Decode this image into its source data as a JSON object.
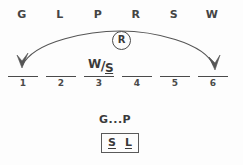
{
  "roster": {
    "letters": [
      {
        "label": "G",
        "x": 22
      },
      {
        "label": "L",
        "x": 60
      },
      {
        "label": "P",
        "x": 98
      },
      {
        "label": "R",
        "x": 136
      },
      {
        "label": "S",
        "x": 174
      },
      {
        "label": "W",
        "x": 212
      }
    ]
  },
  "slots": [
    {
      "number": "1",
      "x": 8
    },
    {
      "number": "2",
      "x": 46
    },
    {
      "number": "3",
      "x": 84
    },
    {
      "number": "4",
      "x": 122
    },
    {
      "number": "5",
      "x": 160
    },
    {
      "number": "6",
      "x": 198
    }
  ],
  "arc": {
    "token_label": "R",
    "path": "M 22 66 C 34 40, 92 31, 120 31 C 152 31, 204 42, 214 66",
    "left_arrow": "M 22 68 L 17 55 L 22 61 L 28 53 Z",
    "right_arrow": "M 215 70 L 209 57 L 215 63 L 220 55 Z",
    "stroke": "#555555"
  },
  "annotations": {
    "fraction": {
      "numerator": "W",
      "bar": "/",
      "denominator": "S"
    },
    "chain": "G...P",
    "block_pair": [
      "S",
      "L"
    ]
  }
}
